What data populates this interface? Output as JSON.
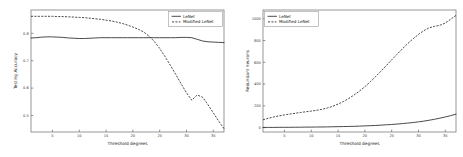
{
  "figure": {
    "background": "#ffffff",
    "line_color": "#2b2b2b",
    "axis_color": "#6a6a6a"
  },
  "chart_data": [
    {
      "type": "line",
      "panel": "left",
      "title": "",
      "xlabel": "Threshold degrees",
      "ylabel": "Testing Accuracy",
      "xlim": [
        1,
        37
      ],
      "ylim": [
        0.44,
        0.885
      ],
      "xticks": [
        5,
        10,
        15,
        20,
        25,
        30,
        35
      ],
      "xticklabels": [
        "5",
        "10",
        "15",
        "20",
        "25",
        "30",
        "35"
      ],
      "yticks": [
        0.5,
        0.6,
        0.7,
        0.8
      ],
      "yticklabels": [
        "0.5",
        "0.6",
        "0.7",
        "0.8"
      ],
      "grid": false,
      "legend_position": "upper right",
      "x": [
        1,
        2,
        3,
        4,
        5,
        6,
        7,
        8,
        9,
        10,
        11,
        12,
        13,
        14,
        15,
        16,
        17,
        18,
        19,
        20,
        21,
        22,
        23,
        24,
        25,
        26,
        27,
        28,
        29,
        30,
        31,
        32,
        33,
        34,
        35,
        36,
        37
      ],
      "series": [
        {
          "name": "LeNet",
          "style": "solid",
          "values": [
            0.783,
            0.784,
            0.786,
            0.787,
            0.787,
            0.786,
            0.785,
            0.783,
            0.782,
            0.781,
            0.781,
            0.782,
            0.783,
            0.784,
            0.784,
            0.784,
            0.784,
            0.784,
            0.784,
            0.784,
            0.784,
            0.784,
            0.784,
            0.784,
            0.784,
            0.784,
            0.784,
            0.784,
            0.785,
            0.785,
            0.784,
            0.778,
            0.772,
            0.769,
            0.768,
            0.767,
            0.766
          ]
        },
        {
          "name": "Modified LeNet",
          "style": "dashed",
          "values": [
            0.862,
            0.862,
            0.862,
            0.862,
            0.862,
            0.861,
            0.861,
            0.86,
            0.859,
            0.858,
            0.857,
            0.855,
            0.853,
            0.851,
            0.848,
            0.845,
            0.841,
            0.836,
            0.83,
            0.823,
            0.815,
            0.805,
            0.79,
            0.77,
            0.745,
            0.715,
            0.683,
            0.65,
            0.616,
            0.583,
            0.556,
            0.575,
            0.567,
            0.54,
            0.51,
            0.48,
            0.452
          ]
        }
      ]
    },
    {
      "type": "line",
      "panel": "right",
      "title": "",
      "xlabel": "Threshold degrees",
      "ylabel": "Redundant neurons",
      "xlim": [
        1,
        37
      ],
      "ylim": [
        -40,
        1080
      ],
      "xticks": [
        5,
        10,
        15,
        20,
        25,
        30,
        35
      ],
      "xticklabels": [
        "5",
        "10",
        "15",
        "20",
        "25",
        "30",
        "35"
      ],
      "yticks": [
        0,
        200,
        400,
        600,
        800,
        1000
      ],
      "yticklabels": [
        "0",
        "200",
        "400",
        "600",
        "800",
        "1000"
      ],
      "grid": false,
      "legend_position": "upper left",
      "x": [
        1,
        2,
        3,
        4,
        5,
        6,
        7,
        8,
        9,
        10,
        11,
        12,
        13,
        14,
        15,
        16,
        17,
        18,
        19,
        20,
        21,
        22,
        23,
        24,
        25,
        26,
        27,
        28,
        29,
        30,
        31,
        32,
        33,
        34,
        35,
        36,
        37
      ],
      "series": [
        {
          "name": "LeNet",
          "style": "solid",
          "values": [
            2,
            2,
            2,
            3,
            3,
            3,
            4,
            4,
            5,
            5,
            6,
            6,
            7,
            8,
            9,
            10,
            11,
            12,
            14,
            16,
            18,
            20,
            23,
            26,
            29,
            33,
            37,
            42,
            47,
            53,
            60,
            68,
            77,
            87,
            98,
            110,
            124
          ]
        },
        {
          "name": "Modified LeNet",
          "style": "dashed",
          "values": [
            72,
            86,
            98,
            108,
            117,
            125,
            132,
            139,
            146,
            152,
            159,
            168,
            180,
            196,
            216,
            240,
            268,
            300,
            336,
            376,
            420,
            468,
            518,
            570,
            622,
            674,
            724,
            772,
            816,
            856,
            890,
            916,
            930,
            940,
            960,
            995,
            1030
          ]
        }
      ]
    }
  ]
}
